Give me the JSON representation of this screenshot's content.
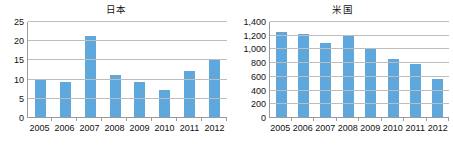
{
  "figure": {
    "panels": [
      "japan",
      "usa"
    ],
    "bar_color": "#5fa8dd",
    "gridline_color": "#bdbdbd",
    "axis_color": "#9a9a9a"
  },
  "chart_data": [
    {
      "id": "japan",
      "type": "bar",
      "title": "日本",
      "xlabel": "",
      "ylabel": "",
      "categories": [
        "2005",
        "2006",
        "2007",
        "2008",
        "2009",
        "2010",
        "2011",
        "2012"
      ],
      "values": [
        10,
        9,
        21,
        11,
        9,
        7,
        12,
        15
      ],
      "ylim": [
        0,
        25
      ],
      "yticks": [
        0,
        5,
        10,
        15,
        20,
        25
      ],
      "ytick_labels": [
        "0",
        "5",
        "10",
        "15",
        "20",
        "25"
      ],
      "grid": true,
      "legend": "none"
    },
    {
      "id": "usa",
      "type": "bar",
      "title": "米国",
      "xlabel": "",
      "ylabel": "",
      "categories": [
        "2005",
        "2006",
        "2007",
        "2008",
        "2009",
        "2010",
        "2011",
        "2012"
      ],
      "values": [
        1240,
        1210,
        1080,
        1180,
        985,
        840,
        770,
        560
      ],
      "ylim": [
        0,
        1400
      ],
      "yticks": [
        0,
        200,
        400,
        600,
        800,
        1000,
        1200,
        1400
      ],
      "ytick_labels": [
        "0",
        "200",
        "400",
        "600",
        "800",
        "1,000",
        "1,200",
        "1,400"
      ],
      "grid": true,
      "legend": "none"
    }
  ]
}
